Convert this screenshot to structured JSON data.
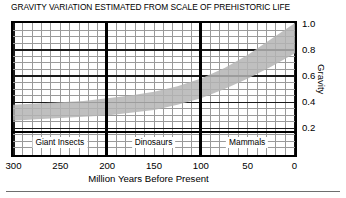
{
  "chart_data": {
    "type": "area",
    "title": "GRAVITY VARIATION ESTIMATED FROM SCALE OF PREHISTORIC LIFE",
    "xlabel": "Million Years Before Present",
    "ylabel": "Gravity",
    "xlim": [
      300,
      0
    ],
    "ylim": [
      0.0,
      1.0
    ],
    "x_inverted": true,
    "grid": true,
    "legend": "none",
    "xticks": [
      300,
      250,
      200,
      150,
      100,
      50,
      0
    ],
    "xtick_labels": [
      "300",
      "250",
      "200",
      "150",
      "100",
      "50",
      "0"
    ],
    "yticks": [
      0.2,
      0.4,
      0.6,
      0.8,
      1.0
    ],
    "ytick_labels": [
      "0.2",
      "0.4",
      "0.6",
      "0.8",
      "1.0"
    ],
    "x_minor_step": 10,
    "x_major_step": 100,
    "y_minor_step": 0.05,
    "y_major_step": 0.2,
    "band": {
      "name": "Estimated gravity range",
      "fill_color": "#b4b4b4",
      "x": [
        300,
        275,
        250,
        225,
        200,
        175,
        150,
        125,
        100,
        75,
        50,
        25,
        0
      ],
      "upper": [
        0.38,
        0.39,
        0.4,
        0.41,
        0.43,
        0.45,
        0.48,
        0.52,
        0.58,
        0.66,
        0.76,
        0.88,
        1.0
      ],
      "lower": [
        0.26,
        0.27,
        0.28,
        0.29,
        0.3,
        0.32,
        0.34,
        0.38,
        0.43,
        0.5,
        0.58,
        0.67,
        0.77
      ]
    },
    "eras": [
      {
        "label": "Giant Insects",
        "start": 300,
        "end": 200,
        "center": 250
      },
      {
        "label": "Dinosaurs",
        "start": 200,
        "end": 100,
        "center": 150
      },
      {
        "label": "Mammals",
        "start": 100,
        "end": 0,
        "center": 50
      }
    ],
    "era_dividers": [
      200,
      100
    ]
  }
}
